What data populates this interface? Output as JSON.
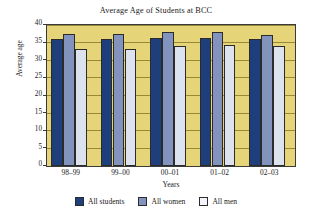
{
  "chart_data": {
    "type": "bar",
    "title": "Average Age of Students at BCC",
    "xlabel": "Years",
    "ylabel": "Average age",
    "categories": [
      "98–99",
      "99–00",
      "00–01",
      "01–02",
      "02–03"
    ],
    "series": [
      {
        "name": "All students",
        "color": "#1F3E7C",
        "values": [
          36.0,
          35.9,
          36.2,
          36.2,
          36.0
        ]
      },
      {
        "name": "All women",
        "color": "#8293BD",
        "values": [
          37.4,
          37.4,
          38.1,
          38.1,
          37.2
        ]
      },
      {
        "name": "All men",
        "color": "#DDE3EE",
        "values": [
          33.2,
          33.2,
          34.0,
          34.3,
          34.0
        ]
      }
    ],
    "ylim": [
      0,
      40
    ],
    "ytick_step": 5,
    "yticks": [
      0,
      5,
      10,
      15,
      20,
      25,
      30,
      35,
      40
    ],
    "grid": true,
    "grid_axis": "y",
    "legend_position": "bottom",
    "plot_background": "#E6D479",
    "figure_background": "#FFFFFF"
  }
}
